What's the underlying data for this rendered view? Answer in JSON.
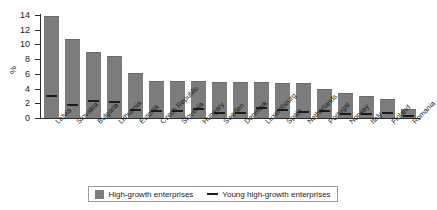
{
  "chart_data": {
    "type": "bar",
    "title": "",
    "subtitle": "",
    "xlabel": "",
    "ylabel": "%",
    "ylim": [
      0,
      14
    ],
    "yticks": [
      0,
      2,
      4,
      6,
      8,
      10,
      12,
      14
    ],
    "grid": true,
    "legend_position": "bottom",
    "categories": [
      "Latvia",
      "Slovakia",
      "Bulgaria",
      "Lithuania",
      "Estonia",
      "Czech Republic",
      "Slovenia",
      "Hungary",
      "Sweden",
      "Denmark",
      "Luxembourg",
      "Spain",
      "Netherlands",
      "Portugal",
      "Norway",
      "Italy",
      "Finland",
      "Romania"
    ],
    "series": [
      {
        "name": "High-growth enterprises",
        "type": "bar",
        "color": "#7c7c7c",
        "values": [
          13.7,
          10.6,
          8.8,
          8.3,
          6.0,
          4.9,
          4.9,
          4.9,
          4.7,
          4.7,
          4.7,
          4.6,
          4.6,
          3.8,
          3.2,
          2.8,
          2.5,
          1.1
        ]
      },
      {
        "name": "Young high-growth enterprises",
        "type": "marker",
        "color": "#1c1c1c",
        "values": [
          2.9,
          1.6,
          2.2,
          2.0,
          0.9,
          0.8,
          0.8,
          1.1,
          0.5,
          0.6,
          1.2,
          0.9,
          0.7,
          0.8,
          0.4,
          0.4,
          0.5,
          0.2
        ]
      }
    ]
  },
  "legend": {
    "items": [
      {
        "label": "High-growth enterprises",
        "marker": "square-swatch"
      },
      {
        "label": "Young high-growth enterprises",
        "marker": "dash-line"
      }
    ]
  }
}
